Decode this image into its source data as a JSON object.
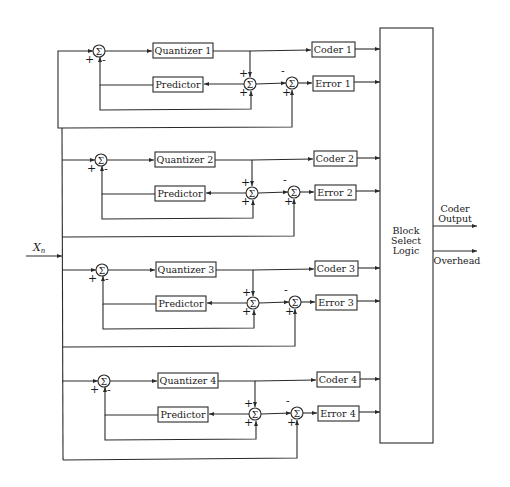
{
  "diagram": {
    "input_label": "X",
    "input_subscript": "n",
    "sum_symbol": "Σ",
    "block_select": {
      "lines": [
        "Block",
        "Select",
        "Logic"
      ]
    },
    "outputs": [
      {
        "label_lines": [
          "Coder",
          "Output"
        ]
      },
      {
        "label_lines": [
          "Overhead"
        ]
      }
    ],
    "channels": [
      {
        "quantizer": "Quantizer 1",
        "predictor": "Predictor",
        "coder": "Coder 1",
        "error": "Error 1"
      },
      {
        "quantizer": "Quantizer 2",
        "predictor": "Predictor",
        "coder": "Coder 2",
        "error": "Error 2"
      },
      {
        "quantizer": "Quantizer 3",
        "predictor": "Predictor",
        "coder": "Coder 3",
        "error": "Error 3"
      },
      {
        "quantizer": "Quantizer 4",
        "predictor": "Predictor",
        "coder": "Coder 4",
        "error": "Error 4"
      }
    ],
    "signs": {
      "plus": "+",
      "minus": "-"
    }
  }
}
